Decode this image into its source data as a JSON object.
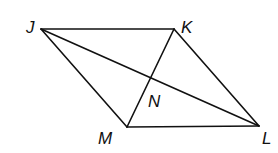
{
  "diagram": {
    "stroke_color": "#111111",
    "background": "#ffffff",
    "points": {
      "J": {
        "x": 41,
        "y": 29,
        "label": "J",
        "label_x": 26,
        "label_y": 33
      },
      "K": {
        "x": 174,
        "y": 29,
        "label": "K",
        "label_x": 181,
        "label_y": 33
      },
      "L": {
        "x": 259,
        "y": 126,
        "label": "L",
        "label_x": 262,
        "label_y": 144
      },
      "M": {
        "x": 127,
        "y": 127,
        "label": "M",
        "label_x": 98,
        "label_y": 144
      },
      "N": {
        "x": 151,
        "y": 79,
        "label": "N",
        "label_x": 148,
        "label_y": 107
      }
    },
    "segments": [
      {
        "name": "JK",
        "from": "J",
        "to": "K"
      },
      {
        "name": "KL",
        "from": "K",
        "to": "L"
      },
      {
        "name": "LM",
        "from": "L",
        "to": "M"
      },
      {
        "name": "MJ",
        "from": "M",
        "to": "J"
      },
      {
        "name": "JL",
        "from": "J",
        "to": "L"
      },
      {
        "name": "KM",
        "from": "K",
        "to": "M"
      }
    ]
  }
}
